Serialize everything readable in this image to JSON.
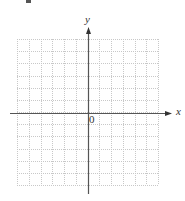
{
  "diagram": {
    "type": "coordinate-grid",
    "axes": {
      "x_label": "x",
      "y_label": "y",
      "origin_label": "0",
      "axis_color": "#555555",
      "arrow_color": "#333333"
    },
    "grid": {
      "columns": 12,
      "rows": 12,
      "line_color": "#c8c8c8",
      "line_style": "dotted",
      "left": 17,
      "right": 158,
      "top": 39,
      "bottom": 185
    },
    "axis_position": {
      "y_axis_x": 88,
      "x_axis_y": 113,
      "x_axis_start": 10,
      "x_axis_end": 172,
      "y_axis_start": 27,
      "y_axis_end": 194
    },
    "top_fragment_color": "#555555"
  }
}
